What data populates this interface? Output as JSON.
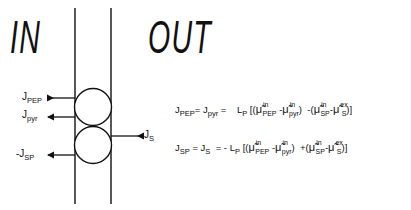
{
  "regions": {
    "inside_label": "IN",
    "outside_label": "OUT"
  },
  "fluxes": {
    "pep": {
      "base": "J",
      "sub": "PEP"
    },
    "pyr": {
      "base": "J",
      "sub": "pyr"
    },
    "sp": {
      "base": "-J",
      "sub": "SP"
    },
    "s": {
      "base": "J",
      "sub": "S"
    }
  },
  "equations": [
    {
      "lhs1": "J",
      "lhs1_sub": "PEP",
      "eq1": "=",
      "lhs2": "J",
      "lhs2_sub": "pyr",
      "eq2": "=",
      "coef_sign": "",
      "coef": "L",
      "coef_sub": "P",
      "open": "[(",
      "t1": {
        "sym": "μ̃",
        "sup": "in",
        "sub": "PEP"
      },
      "minus1": "-",
      "t2": {
        "sym": "μ̃",
        "sup": "in",
        "sub": "pyr"
      },
      "close1": ")",
      "op": "-",
      "open2": "(",
      "t3": {
        "sym": "μ̃",
        "sup": "in",
        "sub": "SP"
      },
      "minus2": "-",
      "t4": {
        "sym": "μ̃",
        "sup": "ex",
        "sub": "S"
      },
      "close2": ")]"
    },
    {
      "lhs1": "J",
      "lhs1_sub": "SP",
      "eq1": "=",
      "lhs2": "J",
      "lhs2_sub": "S",
      "eq2": "=",
      "coef_sign": "-",
      "coef": "L",
      "coef_sub": "P",
      "open": "[(",
      "t1": {
        "sym": "μ̃",
        "sup": "in",
        "sub": "PEP"
      },
      "minus1": "-",
      "t2": {
        "sym": "μ̃",
        "sup": "in",
        "sub": "pyr"
      },
      "close1": ")",
      "op": "+",
      "open2": "(",
      "t3": {
        "sym": "μ̃",
        "sup": "in",
        "sub": "SP"
      },
      "minus2": "-",
      "t4": {
        "sym": "μ̃",
        "sup": "ex",
        "sub": "S"
      },
      "close2": ")]"
    }
  ]
}
